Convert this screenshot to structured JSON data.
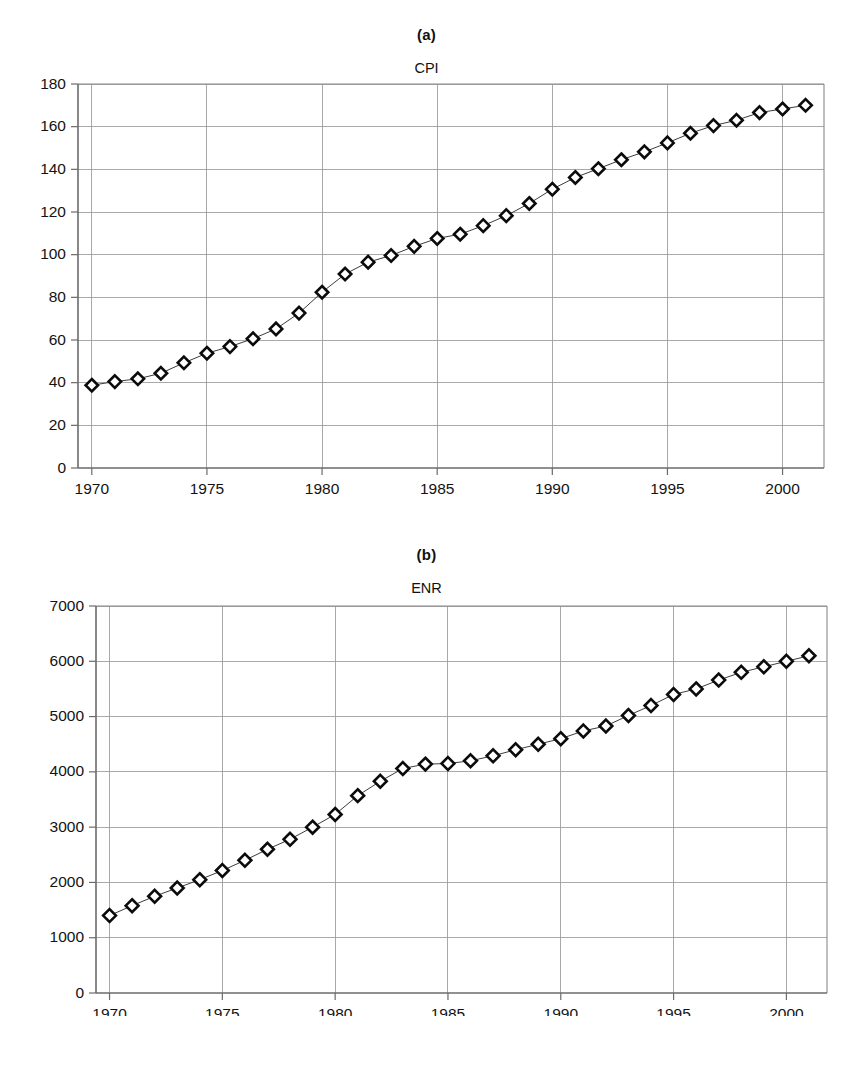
{
  "figure": {
    "panels": [
      {
        "label": "(a)",
        "title": "CPI"
      },
      {
        "label": "(b)",
        "title": "ENR"
      }
    ]
  },
  "chart_data": [
    {
      "type": "line",
      "title": "CPI",
      "panel_label": "(a)",
      "xlabel": "",
      "ylabel": "",
      "xlim": [
        1969.4,
        2001.8
      ],
      "ylim": [
        0,
        180
      ],
      "ytick_step": 20,
      "yticks": [
        0,
        20,
        40,
        60,
        80,
        100,
        120,
        140,
        160,
        180
      ],
      "ytick_labels": [
        "0",
        "20",
        "40",
        "60",
        "80",
        "100",
        "120",
        "140",
        "160",
        "180"
      ],
      "xticks": [
        1970,
        1975,
        1980,
        1985,
        1990,
        1995,
        2000
      ],
      "xtick_labels": [
        "1970",
        "1975",
        "1980",
        "1985",
        "1990",
        "1995",
        "2000"
      ],
      "grid": true,
      "grid_axes": "both",
      "legend": false,
      "marker": "open-diamond",
      "x": [
        1970,
        1971,
        1972,
        1973,
        1974,
        1975,
        1976,
        1977,
        1978,
        1979,
        1980,
        1981,
        1982,
        1983,
        1984,
        1985,
        1986,
        1987,
        1988,
        1989,
        1990,
        1991,
        1992,
        1993,
        1994,
        1995,
        1996,
        1997,
        1998,
        1999,
        2000,
        2001
      ],
      "values": [
        38.8,
        40.5,
        41.8,
        44.4,
        49.3,
        53.8,
        56.9,
        60.6,
        65.2,
        72.6,
        82.4,
        90.9,
        96.5,
        99.6,
        103.9,
        107.6,
        109.6,
        113.6,
        118.3,
        124.0,
        130.7,
        136.2,
        140.3,
        144.5,
        148.2,
        152.4,
        156.9,
        160.5,
        163.0,
        166.6,
        168.3,
        170.0
      ]
    },
    {
      "type": "line",
      "title": "ENR",
      "panel_label": "(b)",
      "xlabel": "",
      "ylabel": "",
      "xlim": [
        1969.4,
        2001.8
      ],
      "ylim": [
        0,
        7000
      ],
      "ytick_step": 1000,
      "yticks": [
        0,
        1000,
        2000,
        3000,
        4000,
        5000,
        6000,
        7000
      ],
      "ytick_labels": [
        "0",
        "1000",
        "2000",
        "3000",
        "4000",
        "5000",
        "6000",
        "7000"
      ],
      "xticks": [
        1970,
        1975,
        1980,
        1985,
        1990,
        1995,
        2000
      ],
      "xtick_labels": [
        "1970",
        "1975",
        "1980",
        "1985",
        "1990",
        "1995",
        "2000"
      ],
      "grid": true,
      "grid_axes": "both",
      "legend": false,
      "marker": "open-diamond",
      "x": [
        1970,
        1971,
        1972,
        1973,
        1974,
        1975,
        1976,
        1977,
        1978,
        1979,
        1980,
        1981,
        1982,
        1983,
        1984,
        1985,
        1986,
        1987,
        1988,
        1989,
        1990,
        1991,
        1992,
        1993,
        1994,
        1995,
        1996,
        1997,
        1998,
        1999,
        2000,
        2001
      ],
      "values": [
        1400,
        1580,
        1750,
        1900,
        2050,
        2215,
        2400,
        2600,
        2780,
        3000,
        3230,
        3570,
        3830,
        4060,
        4140,
        4150,
        4200,
        4290,
        4400,
        4500,
        4600,
        4740,
        4830,
        5020,
        5200,
        5400,
        5500,
        5660,
        5800,
        5900,
        6000,
        6100
      ]
    }
  ]
}
